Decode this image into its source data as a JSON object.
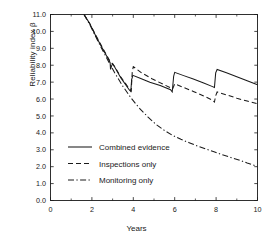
{
  "chart_data": {
    "type": "line",
    "title": "",
    "xlabel": "Years",
    "ylabel": "Reliability index β",
    "xlim": [
      0,
      10
    ],
    "ylim": [
      0,
      11
    ],
    "xticks": [
      0,
      2,
      4,
      6,
      8,
      10
    ],
    "xtick_labels": [
      "0",
      "2",
      "4",
      "6",
      "8",
      "10"
    ],
    "xminor_ticks": [
      1,
      3,
      5,
      7,
      9
    ],
    "yticks": [
      0,
      1,
      2,
      3,
      4,
      5,
      6,
      7,
      8,
      9,
      10,
      11
    ],
    "ytick_labels": [
      "0.0",
      "1.0",
      "2.0",
      "3.0",
      "4.0",
      "5.0",
      "6.0",
      "7.0",
      "8.0",
      "9.0",
      "10.0",
      "11.0"
    ],
    "grid": false,
    "legend_position": "lower-left-inside",
    "series": [
      {
        "name": "Combined evidence",
        "style": "solid",
        "color": "#1a1a1a",
        "points": [
          [
            1.62,
            11.0
          ],
          [
            1.85,
            10.55
          ],
          [
            1.88,
            10.5
          ],
          [
            2.2,
            9.7
          ],
          [
            2.55,
            8.9
          ],
          [
            2.8,
            8.35
          ],
          [
            2.88,
            8.15
          ],
          [
            2.9,
            7.75
          ],
          [
            2.95,
            7.95
          ],
          [
            3.0,
            8.1
          ],
          [
            3.1,
            7.9
          ],
          [
            3.4,
            7.25
          ],
          [
            3.8,
            6.55
          ],
          [
            3.88,
            6.45
          ],
          [
            3.92,
            7.15
          ],
          [
            3.98,
            7.4
          ],
          [
            4.3,
            7.25
          ],
          [
            4.8,
            7.0
          ],
          [
            5.3,
            6.8
          ],
          [
            5.8,
            6.55
          ],
          [
            5.88,
            6.42
          ],
          [
            5.95,
            7.35
          ],
          [
            6.0,
            7.58
          ],
          [
            6.4,
            7.4
          ],
          [
            6.9,
            7.18
          ],
          [
            7.4,
            6.95
          ],
          [
            7.8,
            6.75
          ],
          [
            7.92,
            6.68
          ],
          [
            7.98,
            7.55
          ],
          [
            8.05,
            7.75
          ],
          [
            8.5,
            7.55
          ],
          [
            9.0,
            7.32
          ],
          [
            9.5,
            7.08
          ],
          [
            10.0,
            6.85
          ]
        ]
      },
      {
        "name": "Inspections only",
        "style": "dashed",
        "color": "#1a1a1a",
        "points": [
          [
            1.62,
            11.0
          ],
          [
            1.9,
            10.45
          ],
          [
            2.2,
            9.75
          ],
          [
            2.55,
            8.95
          ],
          [
            2.8,
            8.4
          ],
          [
            2.9,
            8.18
          ],
          [
            3.0,
            8.08
          ],
          [
            3.1,
            7.92
          ],
          [
            3.4,
            7.3
          ],
          [
            3.8,
            6.62
          ],
          [
            3.9,
            6.48
          ],
          [
            3.95,
            7.6
          ],
          [
            4.0,
            7.92
          ],
          [
            4.4,
            7.55
          ],
          [
            4.9,
            7.2
          ],
          [
            5.4,
            6.9
          ],
          [
            5.9,
            6.6
          ],
          [
            6.0,
            6.9
          ],
          [
            6.4,
            6.7
          ],
          [
            6.9,
            6.45
          ],
          [
            7.4,
            6.18
          ],
          [
            7.8,
            5.95
          ],
          [
            7.92,
            5.82
          ],
          [
            7.98,
            6.2
          ],
          [
            8.05,
            6.42
          ],
          [
            8.5,
            6.25
          ],
          [
            9.0,
            6.05
          ],
          [
            9.5,
            5.88
          ],
          [
            10.0,
            5.72
          ]
        ]
      },
      {
        "name": "Monitoring only",
        "style": "dashdot",
        "color": "#1a1a1a",
        "points": [
          [
            1.62,
            11.0
          ],
          [
            1.9,
            10.4
          ],
          [
            2.3,
            9.4
          ],
          [
            2.7,
            8.45
          ],
          [
            3.1,
            7.55
          ],
          [
            3.5,
            6.75
          ],
          [
            3.9,
            6.05
          ],
          [
            4.3,
            5.45
          ],
          [
            4.7,
            4.95
          ],
          [
            5.1,
            4.5
          ],
          [
            5.5,
            4.15
          ],
          [
            5.9,
            3.85
          ],
          [
            6.3,
            3.62
          ],
          [
            6.7,
            3.42
          ],
          [
            7.1,
            3.22
          ],
          [
            7.5,
            3.05
          ],
          [
            7.9,
            2.88
          ],
          [
            8.3,
            2.7
          ],
          [
            8.7,
            2.55
          ],
          [
            9.1,
            2.4
          ],
          [
            9.5,
            2.22
          ],
          [
            10.0,
            2.02
          ]
        ]
      }
    ]
  },
  "legend": {
    "items": [
      {
        "label": "Combined evidence",
        "style": "solid"
      },
      {
        "label": "Inspections only",
        "style": "dashed"
      },
      {
        "label": "Monitoring only",
        "style": "dashdot"
      }
    ]
  },
  "axes": {
    "xlabel": "Years",
    "ylabel": "Reliability index β"
  }
}
